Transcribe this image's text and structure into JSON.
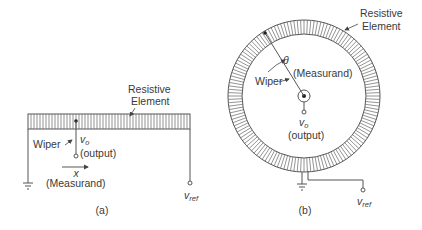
{
  "diagram_a": {
    "element_label_line1": "Resistive",
    "element_label_line2": "Element",
    "wiper_label": "Wiper",
    "output_symbol": "v",
    "output_subscript": "o",
    "output_label": "(output)",
    "measurand_symbol": "x",
    "measurand_label": "(Measurand)",
    "ref_symbol": "v",
    "ref_subscript": "ref",
    "caption": "(a)"
  },
  "diagram_b": {
    "element_label_line1": "Resistive",
    "element_label_line2": "Element",
    "angle_symbol": "θ",
    "measurand_label": "(Measurand)",
    "wiper_label": "Wiper",
    "output_symbol": "v",
    "output_subscript": "o",
    "output_label": "(output)",
    "ref_symbol": "v",
    "ref_subscript": "ref",
    "caption": "(b)"
  },
  "colors": {
    "line": "#555555",
    "text": "#3a3a3a"
  }
}
